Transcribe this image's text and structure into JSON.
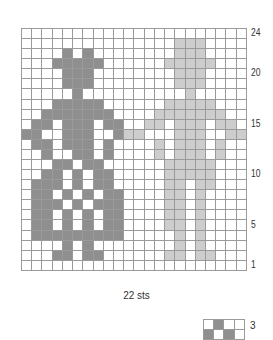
{
  "chart": {
    "columns": 22,
    "rows": 24,
    "colors": {
      "dark": "#8f8f8f",
      "light": "#cdcdcd",
      "empty": "#ffffff",
      "grid": "#9a9a9a"
    },
    "row_labels": [
      {
        "row": 24,
        "text": "24"
      },
      {
        "row": 20,
        "text": "20"
      },
      {
        "row": 15,
        "text": "15"
      },
      {
        "row": 10,
        "text": "10"
      },
      {
        "row": 5,
        "text": "5"
      },
      {
        "row": 1,
        "text": "1"
      }
    ],
    "width_label": "22 sts",
    "cells": {
      "24": {
        "d": [],
        "l": []
      },
      "23": {
        "d": [],
        "l": [
          15,
          16,
          17
        ]
      },
      "22": {
        "d": [
          4,
          6
        ],
        "l": [
          15,
          16,
          17
        ]
      },
      "21": {
        "d": [
          3,
          4,
          5,
          6,
          7
        ],
        "l": [
          14,
          15,
          16,
          17,
          18
        ]
      },
      "20": {
        "d": [
          4,
          5,
          6
        ],
        "l": [
          15,
          16,
          17
        ]
      },
      "19": {
        "d": [
          4,
          5,
          6
        ],
        "l": [
          15,
          16,
          17
        ]
      },
      "18": {
        "d": [
          5
        ],
        "l": [
          16
        ]
      },
      "17": {
        "d": [
          3,
          4,
          5,
          6,
          7
        ],
        "l": [
          14,
          15,
          16,
          17,
          18
        ]
      },
      "16": {
        "d": [
          2,
          3,
          4,
          5,
          6,
          7,
          8
        ],
        "l": [
          13,
          14,
          15,
          16,
          17,
          18,
          19
        ]
      },
      "15": {
        "d": [
          1,
          2,
          4,
          5,
          6,
          8,
          9
        ],
        "l": [
          12,
          13,
          15,
          16,
          17,
          19,
          20
        ]
      },
      "14": {
        "d": [
          0,
          1,
          4,
          5,
          6,
          9
        ],
        "l": [
          10,
          11,
          15,
          16,
          17,
          20,
          21
        ]
      },
      "13": {
        "d": [
          1,
          2,
          4,
          5,
          6,
          8
        ],
        "l": [
          13,
          15,
          16,
          17,
          19
        ]
      },
      "12": {
        "d": [
          2,
          5,
          6,
          8
        ],
        "l": [
          13,
          15,
          16,
          17,
          19
        ]
      },
      "11": {
        "d": [
          3,
          4,
          6,
          7
        ],
        "l": [
          14,
          15,
          16,
          17,
          18
        ]
      },
      "10": {
        "d": [
          2,
          3,
          5,
          7,
          8
        ],
        "l": [
          14,
          15,
          16,
          17,
          18
        ]
      },
      "9": {
        "d": [
          1,
          2,
          3,
          5,
          7,
          8
        ],
        "l": [
          14,
          15,
          17,
          18
        ]
      },
      "8": {
        "d": [
          1,
          2,
          4,
          6,
          8,
          9
        ],
        "l": [
          14,
          15,
          17
        ]
      },
      "7": {
        "d": [
          1,
          2,
          3,
          5,
          7,
          8,
          9
        ],
        "l": [
          14,
          15,
          17
        ]
      },
      "6": {
        "d": [
          1,
          2,
          4,
          6,
          8,
          9
        ],
        "l": [
          14,
          15,
          17
        ]
      },
      "5": {
        "d": [
          1,
          2,
          4,
          6,
          8,
          9
        ],
        "l": [
          14,
          15,
          17
        ]
      },
      "4": {
        "d": [
          1,
          2,
          3,
          4,
          5,
          6,
          7,
          8,
          9
        ],
        "l": [
          15,
          17
        ]
      },
      "3": {
        "d": [
          4,
          6
        ],
        "l": [
          15,
          17
        ]
      },
      "2": {
        "d": [
          3,
          4,
          6,
          7
        ],
        "l": [
          14,
          15,
          17,
          18
        ]
      },
      "1": {
        "d": [],
        "l": []
      }
    }
  },
  "legend": {
    "label": "3",
    "cells": [
      [
        "empty",
        "dark",
        "empty",
        "empty"
      ],
      [
        "dark",
        "empty",
        "dark",
        "empty"
      ]
    ]
  }
}
